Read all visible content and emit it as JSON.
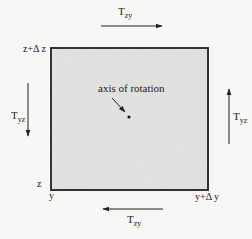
{
  "diagram": {
    "element": {
      "fill_color": "#e4e4e2",
      "border_color": "#333333"
    },
    "corner_labels": {
      "top_left": "z+Δ z",
      "bottom_left_z": "z",
      "bottom_left_y": "y",
      "bottom_right": "y+Δ y"
    },
    "center": {
      "label": "axis of rotation"
    },
    "forces": [
      {
        "id": "top",
        "symbol": "T",
        "subscript": "zy",
        "direction": "right"
      },
      {
        "id": "bottom",
        "symbol": "T",
        "subscript": "zy",
        "direction": "left"
      },
      {
        "id": "left",
        "symbol": "T",
        "subscript": "yz",
        "direction": "down"
      },
      {
        "id": "right",
        "symbol": "T",
        "subscript": "yz",
        "direction": "up"
      }
    ]
  }
}
